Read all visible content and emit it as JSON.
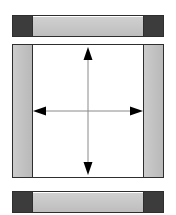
{
  "figure": {
    "width_px": 176,
    "height_px": 215,
    "background_color": "#ffffff"
  },
  "colors": {
    "outline": "#2e2e2e",
    "cap_dark_gray": "#3c3c3c",
    "bar_light_gray": "#c9c9c9",
    "rail_gray": "#c2c2c2",
    "panel_white": "#ffffff",
    "arrow_line_gray": "#8a8a8a",
    "arrow_head_black": "#000000"
  },
  "components": {
    "top_bar": {
      "name": "top flange bar",
      "left_cap_label": "",
      "right_cap_label": "",
      "web_label": ""
    },
    "panel": {
      "name": "central web panel",
      "left_rail_label": "",
      "right_rail_label": "",
      "interior_label": ""
    },
    "bottom_bar": {
      "name": "bottom flange bar",
      "left_cap_label": "",
      "right_cap_label": "",
      "web_label": ""
    }
  },
  "annotations": {
    "vertical_arrow": {
      "icon": "double-headed-vertical-arrow",
      "label": ""
    },
    "horizontal_arrow": {
      "icon": "double-headed-horizontal-arrow",
      "label": ""
    }
  }
}
